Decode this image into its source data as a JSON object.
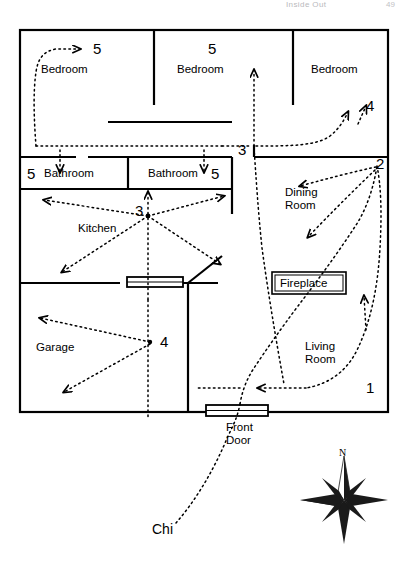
{
  "header": {
    "running_title": "Inside Out",
    "page_number": "49"
  },
  "diagram": {
    "type": "floor-plan",
    "chi_label": "Chi",
    "compass_label": "N",
    "compass_icon": "compass-rose-icon"
  },
  "rooms": [
    {
      "id": "bedroom-left",
      "label": "Bedroom",
      "marker": "5"
    },
    {
      "id": "bedroom-middle",
      "label": "Bedroom",
      "marker": "5"
    },
    {
      "id": "bedroom-right",
      "label": "Bedroom",
      "marker": "4"
    },
    {
      "id": "bathroom-left",
      "label": "Bathroom",
      "marker": "5"
    },
    {
      "id": "bathroom-right",
      "label": "Bathroom",
      "marker": "5"
    },
    {
      "id": "kitchen",
      "label": "Kitchen",
      "marker": "3"
    },
    {
      "id": "garage",
      "label": "Garage",
      "marker": "4"
    },
    {
      "id": "dining-room",
      "label": "Dining\nRoom",
      "marker": "2"
    },
    {
      "id": "living-room",
      "label": "Living\nRoom",
      "marker": "1"
    }
  ],
  "room_labels": {
    "bedroom_left": "Bedroom",
    "bedroom_middle": "Bedroom",
    "bedroom_right": "Bedroom",
    "bathroom_left": "Bathroom",
    "bathroom_right": "Bathroom",
    "kitchen": "Kitchen",
    "garage": "Garage",
    "dining_line1": "Dining",
    "dining_line2": "Room",
    "living_line1": "Living",
    "living_line2": "Room",
    "fireplace": "Fireplace",
    "front_door_line1": "Front",
    "front_door_line2": "Door"
  },
  "markers": {
    "bedroom_left": "5",
    "bedroom_middle": "5",
    "bedroom_right": "4",
    "bathroom_left": "5",
    "bathroom_right": "5",
    "hall_junction": "3",
    "kitchen": "3",
    "garage": "4",
    "dining": "2",
    "living": "1"
  },
  "features": {
    "fireplace_label": "Fireplace",
    "front_door_label": "Front Door",
    "interior_door": "door-symbol",
    "front_door": "door-symbol"
  },
  "colors": {
    "wall": "#000000",
    "chi_flow": "#1a1a1a",
    "background": "#ffffff"
  }
}
